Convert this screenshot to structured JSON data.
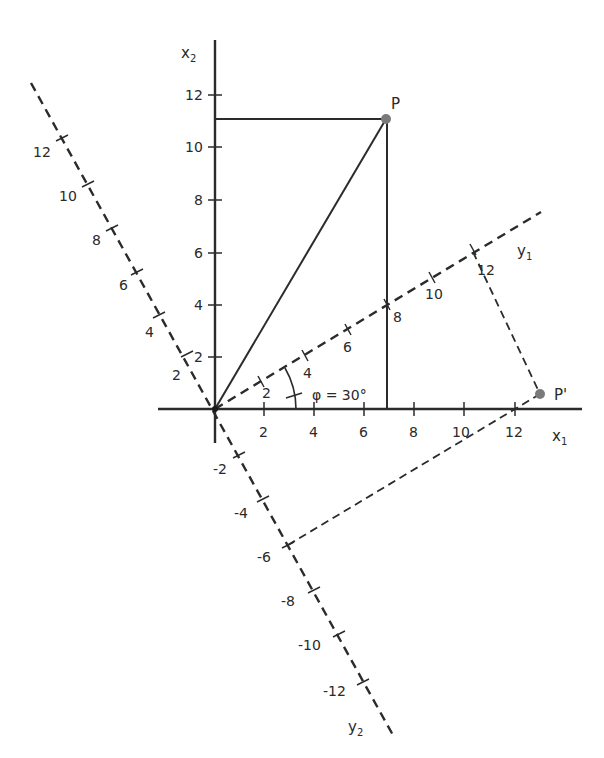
{
  "diagram": {
    "type": "coordinate-rotation",
    "colors": {
      "line": "#2b2b2b",
      "point": "#7a7a7a",
      "background": "#ffffff"
    },
    "axes": {
      "x1": {
        "label": "x",
        "sub": "1",
        "ticks": [
          "2",
          "4",
          "6",
          "8",
          "10",
          "12"
        ]
      },
      "x2": {
        "label": "x",
        "sub": "2",
        "ticks": [
          "2",
          "4",
          "6",
          "8",
          "10",
          "12"
        ]
      },
      "y1": {
        "label": "y",
        "sub": "1",
        "ticks": [
          "2",
          "4",
          "6",
          "8",
          "10",
          "12"
        ]
      },
      "y2": {
        "label": "y",
        "sub": "2",
        "ticks_positive": [
          "2",
          "4",
          "6",
          "8",
          "10",
          "12"
        ],
        "ticks_negative": [
          "-2",
          "-4",
          "-6",
          "-8",
          "-10",
          "-12"
        ]
      }
    },
    "angle": {
      "label": "φ = 30°"
    },
    "points": {
      "P": {
        "label": "P"
      },
      "P_prime": {
        "label": "P'"
      }
    }
  }
}
